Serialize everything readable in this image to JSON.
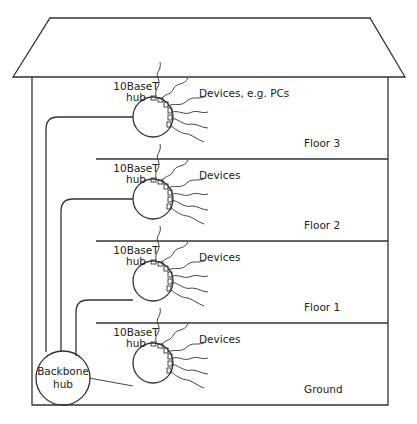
{
  "diagram": {
    "type": "building network topology",
    "floors": [
      {
        "label": "Floor 3",
        "hub_label_line1": "10BaseT",
        "hub_label_line2": "hub",
        "devices_label": "Devices, e.g. PCs"
      },
      {
        "label": "Floor 2",
        "hub_label_line1": "10BaseT",
        "hub_label_line2": "hub",
        "devices_label": "Devices"
      },
      {
        "label": "Floor 1",
        "hub_label_line1": "10BaseT",
        "hub_label_line2": "hub",
        "devices_label": "Devices"
      },
      {
        "label": "Ground",
        "hub_label_line1": "10BaseT",
        "hub_label_line2": "hub",
        "devices_label": "Devices"
      }
    ],
    "backbone": {
      "line1": "Backbone",
      "line2": "hub"
    },
    "colors": {
      "line": "#333333",
      "background": "#ffffff",
      "text": "#222222"
    }
  }
}
